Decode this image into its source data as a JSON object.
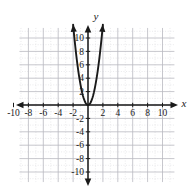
{
  "chart_data": {
    "type": "line",
    "title": "",
    "subtitle": "",
    "xlabel": "x",
    "ylabel": "y",
    "xlim": [
      -11,
      11
    ],
    "ylim": [
      -11.5,
      11.5
    ],
    "grid": true,
    "grid_step": 1,
    "legend": "none",
    "x_ticks": [
      -10,
      -8,
      -6,
      -4,
      -2,
      2,
      4,
      6,
      8,
      10
    ],
    "x_tick_labels": [
      "-10",
      "-8",
      "-6",
      "-4",
      "-2",
      "2",
      "4",
      "6",
      "8",
      "10"
    ],
    "y_ticks": [
      10,
      8,
      6,
      4,
      2,
      -2,
      -4,
      -6,
      -8,
      -10
    ],
    "y_tick_labels": [
      "10",
      "8",
      "6",
      "4",
      "2",
      "-2",
      "-4",
      "-6",
      "-8",
      "-10"
    ],
    "annotations": [],
    "series": [
      {
        "name": "parabola",
        "equation": "y = 3x^2",
        "vertex": [
          0,
          0
        ],
        "color": "#1a1a1a",
        "arrows": "both",
        "x": [
          -2.0,
          -1.9,
          -1.8,
          -1.7,
          -1.6,
          -1.5,
          -1.4,
          -1.3,
          -1.2,
          -1.1,
          -1.0,
          -0.9,
          -0.8,
          -0.7,
          -0.6,
          -0.5,
          -0.4,
          -0.3,
          -0.2,
          -0.1,
          0.0,
          0.1,
          0.2,
          0.3,
          0.4,
          0.5,
          0.6,
          0.7,
          0.8,
          0.9,
          1.0,
          1.1,
          1.2,
          1.3,
          1.4,
          1.5,
          1.6,
          1.7,
          1.8,
          1.9,
          2.0
        ],
        "values": [
          12.0,
          10.83,
          9.72,
          8.67,
          7.68,
          6.75,
          5.88,
          5.07,
          4.32,
          3.63,
          3.0,
          2.43,
          1.92,
          1.47,
          1.08,
          0.75,
          0.48,
          0.27,
          0.12,
          0.03,
          0.0,
          0.03,
          0.12,
          0.27,
          0.48,
          0.75,
          1.08,
          1.47,
          1.92,
          2.43,
          3.0,
          3.63,
          4.32,
          5.07,
          5.88,
          6.75,
          7.68,
          8.67,
          9.72,
          10.83,
          12.0
        ]
      }
    ],
    "colors": {
      "curve": "#1a1a1a",
      "axis": "#1a1a1a",
      "grid_minor": "#d8d8dc",
      "grid_major": "#b9b9c0",
      "background": "#ffffff",
      "text": "#1a1a1a"
    }
  },
  "axes": {
    "x_name": "x",
    "y_name": "y"
  }
}
